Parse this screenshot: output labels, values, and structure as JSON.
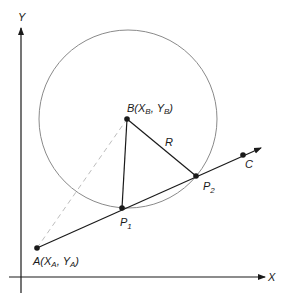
{
  "diagram": {
    "type": "geometry",
    "colors": {
      "line": "#1a1a1a",
      "circle": "#8a8a8a",
      "dashed": "#bdbdbd",
      "background": "#ffffff"
    },
    "axes": {
      "x_label": "X",
      "y_label": "Y"
    },
    "points": {
      "A": {
        "name": "A",
        "x_name": "X",
        "x_sub": "A",
        "y_name": "Y",
        "y_sub": "A"
      },
      "B": {
        "name": "B",
        "x_name": "X",
        "x_sub": "B",
        "y_name": "Y",
        "y_sub": "B"
      },
      "C": {
        "name": "C"
      },
      "P1": {
        "name": "P",
        "sub": "1"
      },
      "P2": {
        "name": "P",
        "sub": "2"
      }
    },
    "radius_label": "R",
    "labels": {
      "open_paren": "(",
      "comma": ", ",
      "close_paren": ")"
    }
  }
}
